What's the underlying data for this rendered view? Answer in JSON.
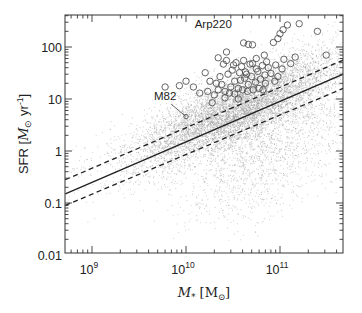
{
  "chart_data": {
    "type": "scatter",
    "title": "",
    "xlabel": "M* [M☉]",
    "ylabel": "SFR [M☉ yr⁻¹]",
    "xscale": "log",
    "yscale": "log",
    "xlim": [
      520000000.0,
      470000000000.0
    ],
    "ylim": [
      0.01,
      400
    ],
    "grid": false,
    "legend": null,
    "x_ticks": [
      {
        "value": 1000000000.0,
        "base": "10",
        "exp": "9"
      },
      {
        "value": 10000000000.0,
        "base": "10",
        "exp": "10"
      },
      {
        "value": 100000000000.0,
        "base": "10",
        "exp": "11"
      }
    ],
    "y_ticks": [
      {
        "value": 100,
        "label": "100"
      },
      {
        "value": 10,
        "label": "10"
      },
      {
        "value": 1,
        "label": "1"
      },
      {
        "value": 0.1,
        "label": "0.1"
      },
      {
        "value": 0.01,
        "label": "0.01"
      }
    ],
    "series": [
      {
        "name": "main sequence fit",
        "type": "line",
        "style": "solid",
        "x": [
          520000000.0,
          470000000000.0
        ],
        "y": [
          0.15,
          30
        ]
      },
      {
        "name": "upper scatter bound",
        "type": "line",
        "style": "dashed",
        "x": [
          520000000.0,
          470000000000.0
        ],
        "y": [
          0.28,
          56
        ]
      },
      {
        "name": "lower scatter bound",
        "type": "line",
        "style": "dashed",
        "x": [
          520000000.0,
          470000000000.0
        ],
        "y": [
          0.09,
          16
        ]
      },
      {
        "name": "galaxy population (dots)",
        "type": "scatter",
        "marker": "dot",
        "color": "#9a9a9a",
        "description": "dense cloud of ~tens of thousands of small gray points centered on main sequence, spreading below toward high mass",
        "distribution": {
          "count": 9000,
          "logM_range": [
            8.72,
            11.67
          ],
          "logM_peak": 10.6,
          "slope": 0.77,
          "intercept_logSFR_at_logM10": 0.37,
          "sigma_dex": 0.35,
          "quenched_fraction": 0.3,
          "quenched_offset_dex": -1.1,
          "seed": 7
        }
      },
      {
        "name": "starburst galaxies (circles)",
        "type": "scatter",
        "marker": "open-circle",
        "points": [
          [
            33000000000.0,
            22
          ],
          [
            38000000000.0,
            23
          ],
          [
            42000000000.0,
            25
          ],
          [
            46000000000.0,
            19
          ],
          [
            50000000000.0,
            27
          ],
          [
            55000000000.0,
            21
          ],
          [
            62000000000.0,
            24
          ],
          [
            70000000000.0,
            20
          ],
          [
            30000000000.0,
            17
          ],
          [
            36000000000.0,
            16
          ],
          [
            40000000000.0,
            15
          ],
          [
            45000000000.0,
            14
          ],
          [
            52000000000.0,
            15
          ],
          [
            60000000000.0,
            16
          ],
          [
            66000000000.0,
            15
          ],
          [
            26000000000.0,
            14
          ],
          [
            29000000000.0,
            13
          ],
          [
            33000000000.0,
            12.5
          ],
          [
            24000000000.0,
            19
          ],
          [
            22000000000.0,
            15
          ],
          [
            20000000000.0,
            12
          ],
          [
            17000000000.0,
            14
          ],
          [
            14000000000.0,
            13
          ],
          [
            18000000000.0,
            22
          ],
          [
            23000000000.0,
            27
          ],
          [
            28000000000.0,
            30
          ],
          [
            31000000000.0,
            36
          ],
          [
            43000000000.0,
            33
          ],
          [
            58000000000.0,
            34
          ],
          [
            80000000000.0,
            31
          ],
          [
            95000000000.0,
            27
          ],
          [
            75000000000.0,
            40
          ],
          [
            65000000000.0,
            44
          ],
          [
            48000000000.0,
            47
          ],
          [
            34000000000.0,
            50
          ],
          [
            27000000000.0,
            55
          ],
          [
            41000000000.0,
            55
          ],
          [
            51000000000.0,
            48
          ],
          [
            72000000000.0,
            52
          ],
          [
            90000000000.0,
            45
          ],
          [
            105000000000.0,
            38
          ],
          [
            39000000000.0,
            42
          ],
          [
            32000000000.0,
            45
          ],
          [
            25000000000.0,
            47
          ],
          [
            69000000000.0,
            29
          ],
          [
            88000000000.0,
            22
          ],
          [
            56000000000.0,
            38
          ],
          [
            44000000000.0,
            30
          ],
          [
            37000000000.0,
            32
          ],
          [
            21000000000.0,
            20
          ],
          [
            12000000000.0,
            17
          ],
          [
            8500000000.0,
            18
          ],
          [
            10000000000.0,
            22
          ],
          [
            16000000000.0,
            32
          ],
          [
            6000000000.0,
            17
          ],
          [
            36000000000.0,
            10
          ],
          [
            26000000000.0,
            10.5
          ],
          [
            19000000000.0,
            8.5
          ],
          [
            41000000000.0,
            120
          ],
          [
            51000000000.0,
            110
          ],
          [
            46000000000.0,
            112
          ],
          [
            85000000000.0,
            122
          ],
          [
            95000000000.0,
            145
          ],
          [
            100000000000.0,
            180
          ],
          [
            108000000000.0,
            215
          ],
          [
            120000000000.0,
            265
          ],
          [
            160000000000.0,
            280
          ],
          [
            250000000000.0,
            200
          ],
          [
            310000000000.0,
            70
          ],
          [
            27000000000.0,
            80
          ],
          [
            56000000000.0,
            60
          ],
          [
            110000000000.0,
            58
          ],
          [
            145000000000.0,
            64
          ],
          [
            130000000000.0,
            48
          ],
          [
            22000000000.0,
            62
          ],
          [
            68000000000.0,
            70
          ]
        ]
      }
    ],
    "annotations": [
      {
        "text": "Arp220",
        "x": 19500000000.0,
        "y": 230
      },
      {
        "text": "M82",
        "x": 6000000000.0,
        "y": 9.5,
        "arrow_to": [
          10000000000.0,
          4.6
        ]
      }
    ]
  },
  "axes": {
    "x_title_main": "M",
    "x_title_sub": "*",
    "x_title_unit_open": " [M",
    "x_title_unit_sub": "⊙",
    "x_title_unit_close": "]",
    "y_title_prefix": "SFR [",
    "y_title_m": "M",
    "y_title_sun": "⊙",
    "y_title_unit": " yr",
    "y_title_exp": "-1",
    "y_title_close": "]"
  },
  "layout": {
    "frame": {
      "left": 65,
      "top": 15,
      "right": 343,
      "bottom": 253
    },
    "x_px_per_decade": 94,
    "x_px_at_1e9": 92,
    "y_px_per_decade": 52,
    "y_px_at_1": 151,
    "colors": {
      "frame": "#333333",
      "line": "#222222",
      "dots": "#9a9a9a",
      "circles": "#555555",
      "text": "#222222"
    }
  }
}
